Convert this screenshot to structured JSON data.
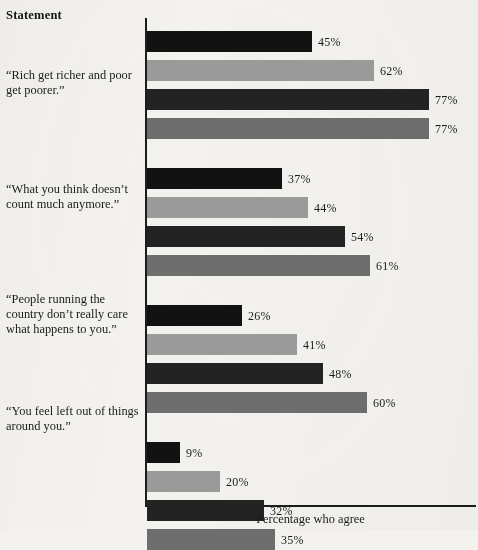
{
  "header": {
    "column_title": "Statement"
  },
  "axis": {
    "x_title": "Percentage who agree"
  },
  "chart_data": {
    "type": "bar",
    "orientation": "horizontal",
    "title": "",
    "subtitle": "",
    "xlabel": "Percentage who agree",
    "ylabel": "Statement",
    "xlim": [
      0,
      80
    ],
    "grid": false,
    "legend": "none",
    "value_suffix": "%",
    "categories": [
      "“Rich get richer and poor get poorer.”",
      "“What you think doesn’t count much anymore.”",
      "“People running the country don’t really care what happens to you.”",
      "“You feel left out of things around you.”"
    ],
    "series": [
      {
        "name": "Series 1",
        "color": "#121212",
        "values": [
          45,
          37,
          26,
          9
        ]
      },
      {
        "name": "Series 2",
        "color": "#9b9b9b",
        "values": [
          62,
          44,
          41,
          20
        ]
      },
      {
        "name": "Series 3",
        "color": "#232323",
        "values": [
          77,
          54,
          48,
          32
        ]
      },
      {
        "name": "Series 4",
        "color": "#6e6e6e",
        "values": [
          77,
          61,
          60,
          35
        ]
      }
    ],
    "bars": [
      {
        "group": 0,
        "series": 0,
        "value": 45,
        "label": "45%",
        "color": "#121212"
      },
      {
        "group": 0,
        "series": 1,
        "value": 62,
        "label": "62%",
        "color": "#9b9b9b"
      },
      {
        "group": 0,
        "series": 2,
        "value": 77,
        "label": "77%",
        "color": "#232323"
      },
      {
        "group": 0,
        "series": 3,
        "value": 77,
        "label": "77%",
        "color": "#6e6e6e"
      },
      {
        "group": 1,
        "series": 0,
        "value": 37,
        "label": "37%",
        "color": "#121212"
      },
      {
        "group": 1,
        "series": 1,
        "value": 44,
        "label": "44%",
        "color": "#9b9b9b"
      },
      {
        "group": 1,
        "series": 2,
        "value": 54,
        "label": "54%",
        "color": "#232323"
      },
      {
        "group": 1,
        "series": 3,
        "value": 61,
        "label": "61%",
        "color": "#6e6e6e"
      },
      {
        "group": 2,
        "series": 0,
        "value": 26,
        "label": "26%",
        "color": "#121212"
      },
      {
        "group": 2,
        "series": 1,
        "value": 41,
        "label": "41%",
        "color": "#9b9b9b"
      },
      {
        "group": 2,
        "series": 2,
        "value": 48,
        "label": "48%",
        "color": "#232323"
      },
      {
        "group": 2,
        "series": 3,
        "value": 60,
        "label": "60%",
        "color": "#6e6e6e"
      },
      {
        "group": 3,
        "series": 0,
        "value": 9,
        "label": "9%",
        "color": "#121212"
      },
      {
        "group": 3,
        "series": 1,
        "value": 20,
        "label": "20%",
        "color": "#9b9b9b"
      },
      {
        "group": 3,
        "series": 2,
        "value": 32,
        "label": "32%",
        "color": "#232323"
      },
      {
        "group": 3,
        "series": 3,
        "value": 35,
        "label": "35%",
        "color": "#6e6e6e"
      }
    ]
  },
  "layout": {
    "axis_x_px": 147,
    "px_per_percent": 3.66,
    "bar_height_px": 21,
    "bar_gap_px": 8,
    "group_gap_px": 29,
    "first_bar_top_px": 31,
    "label_offset_px": 6,
    "statement_label_tops_px": [
      68,
      182,
      292,
      404
    ]
  },
  "colors": {
    "background": "#f4f2ee",
    "axis": "#1c1c1c",
    "text": "#1b1b1b"
  }
}
